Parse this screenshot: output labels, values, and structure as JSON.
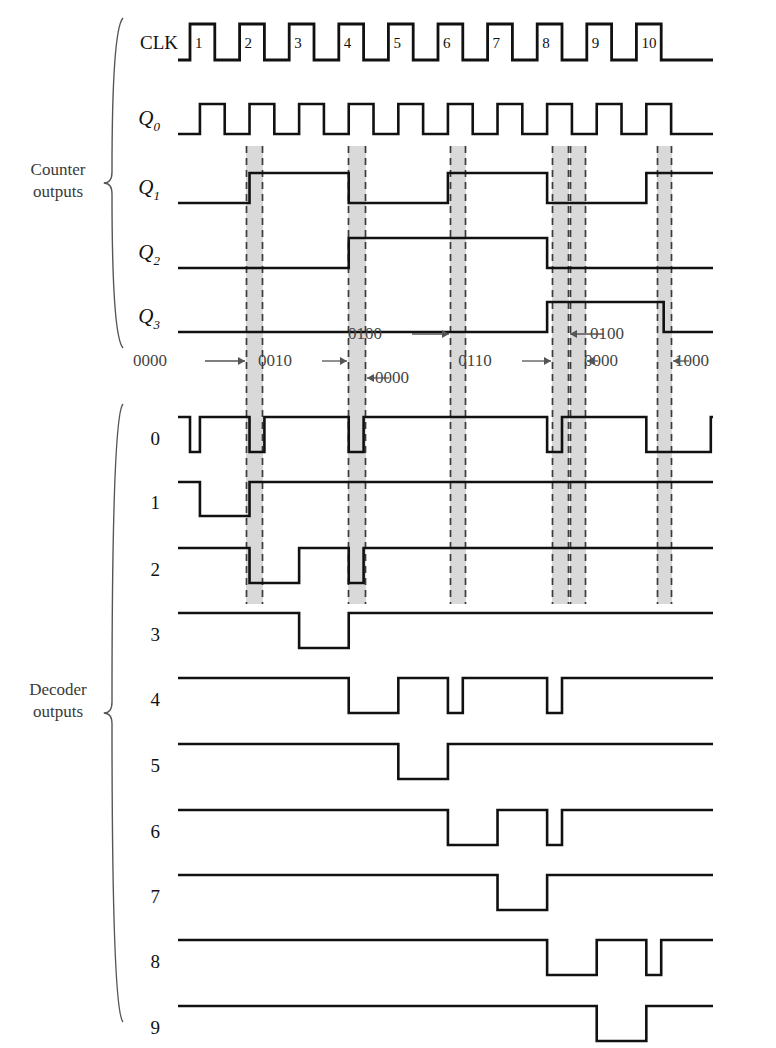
{
  "figure": {
    "type": "digital-timing-diagram",
    "groups": [
      {
        "id": "counter",
        "label_line1": "Counter",
        "label_line2": "outputs"
      },
      {
        "id": "decoder",
        "label_line1": "Decoder",
        "label_line2": "outputs"
      }
    ],
    "clock": {
      "label": "CLK",
      "pulse_numbers": [
        "1",
        "2",
        "3",
        "4",
        "5",
        "6",
        "7",
        "8",
        "9",
        "10"
      ]
    },
    "counter_signals": [
      {
        "name": "Q",
        "subscript": "0"
      },
      {
        "name": "Q",
        "subscript": "1"
      },
      {
        "name": "Q",
        "subscript": "2"
      },
      {
        "name": "Q",
        "subscript": "3"
      }
    ],
    "decoder_signals": [
      {
        "label": "0"
      },
      {
        "label": "1"
      },
      {
        "label": "2"
      },
      {
        "label": "3"
      },
      {
        "label": "4"
      },
      {
        "label": "5"
      },
      {
        "label": "6"
      },
      {
        "label": "7"
      },
      {
        "label": "8"
      },
      {
        "label": "9"
      }
    ],
    "state_annotations": [
      {
        "value": "0000",
        "direction": "right"
      },
      {
        "value": "0010",
        "direction": "right"
      },
      {
        "value": "0100",
        "direction": "right"
      },
      {
        "value": "0000",
        "direction": "left"
      },
      {
        "value": "0110",
        "direction": "right"
      },
      {
        "value": "0100",
        "direction": "left"
      },
      {
        "value": "0000",
        "direction": "left"
      },
      {
        "value": "1000",
        "direction": "left"
      }
    ],
    "glitch_band_count": 6,
    "colors": {
      "waveform": "#111111",
      "band_fill": "#b9b9b9",
      "band_dash": "#3b3b3b",
      "annotation": "#444444",
      "brace": "#555555",
      "background": "#ffffff"
    }
  },
  "chart_data": {
    "type": "line",
    "title": "",
    "xlabel": "",
    "ylabel": "",
    "grid": false,
    "geometry": {
      "t0": 190,
      "period": 49.6,
      "cycles": 10,
      "clk_high": 24,
      "clk_low": 60,
      "wave_right": 713
    },
    "glitch_bands": [
      {
        "x": 246,
        "w": 17,
        "after_clock": 2
      },
      {
        "x": 348,
        "w": 18,
        "after_clock": 4
      },
      {
        "x": 450,
        "w": 16,
        "after_clock": 6
      },
      {
        "x": 552,
        "w": 17,
        "after_clock": 8
      },
      {
        "x": 570,
        "w": 16,
        "after_clock": 8
      },
      {
        "x": 657,
        "w": 15,
        "after_clock": 10
      }
    ],
    "counter_waves": [
      {
        "name": "Q0",
        "baseline": 134,
        "high": 104,
        "edges": [
          0.2,
          1.2,
          2.2,
          3.2,
          4.2,
          5.2,
          6.2,
          7.2,
          8.2,
          9.2,
          10.2
        ],
        "start_level": 0
      },
      {
        "name": "Q1",
        "baseline": 203,
        "high": 173,
        "transitions": [
          [
            1.2,
            1
          ],
          [
            3.2,
            0
          ],
          [
            5.2,
            1
          ],
          [
            7.2,
            0
          ],
          [
            9.2,
            1
          ]
        ],
        "start_level": 0
      },
      {
        "name": "Q2",
        "baseline": 268,
        "high": 238,
        "transitions": [
          [
            3.2,
            1
          ],
          [
            7.2,
            0
          ]
        ],
        "start_level": 0
      },
      {
        "name": "Q3",
        "baseline": 332,
        "high": 302,
        "transitions": [
          [
            7.2,
            1
          ],
          [
            9.55,
            0
          ]
        ],
        "start_level": 0
      }
    ],
    "decoder_waves": [
      {
        "name": "0",
        "baseline": 452,
        "high": 417,
        "active_low": true,
        "low_windows": [
          [
            0.0,
            0.2
          ],
          [
            1.2,
            1.5
          ],
          [
            3.2,
            3.5
          ],
          [
            7.2,
            7.5
          ],
          [
            9.2,
            10.5
          ]
        ]
      },
      {
        "name": "1",
        "baseline": 516,
        "high": 482,
        "active_low": true,
        "low_windows": [
          [
            0.2,
            1.2
          ]
        ]
      },
      {
        "name": "2",
        "baseline": 583,
        "high": 548,
        "active_low": true,
        "low_windows": [
          [
            1.2,
            2.2
          ],
          [
            3.2,
            3.5
          ]
        ]
      },
      {
        "name": "3",
        "baseline": 648,
        "high": 613,
        "active_low": true,
        "low_windows": [
          [
            2.2,
            3.2
          ]
        ]
      },
      {
        "name": "4",
        "baseline": 713,
        "high": 678,
        "active_low": true,
        "low_windows": [
          [
            3.2,
            4.2
          ],
          [
            5.2,
            5.5
          ],
          [
            7.2,
            7.5
          ]
        ]
      },
      {
        "name": "5",
        "baseline": 779,
        "high": 744,
        "active_low": true,
        "low_windows": [
          [
            4.2,
            5.2
          ]
        ]
      },
      {
        "name": "6",
        "baseline": 845,
        "high": 810,
        "active_low": true,
        "low_windows": [
          [
            5.2,
            6.2
          ],
          [
            7.2,
            7.5
          ]
        ]
      },
      {
        "name": "7",
        "baseline": 910,
        "high": 875,
        "active_low": true,
        "low_windows": [
          [
            6.2,
            7.2
          ]
        ]
      },
      {
        "name": "8",
        "baseline": 975,
        "high": 940,
        "active_low": true,
        "low_windows": [
          [
            7.2,
            8.2
          ],
          [
            9.2,
            9.5
          ]
        ]
      },
      {
        "name": "9",
        "baseline": 1041,
        "high": 1006,
        "active_low": true,
        "low_windows": [
          [
            8.2,
            9.2
          ]
        ]
      }
    ],
    "annotation_positions": [
      {
        "value": "0000",
        "x": 150,
        "y": 366,
        "dir": "right",
        "ax1": 205,
        "ax2": 245
      },
      {
        "value": "0010",
        "x": 275,
        "y": 366,
        "dir": "right",
        "ax1": 322,
        "ax2": 347
      },
      {
        "value": "0100",
        "x": 365,
        "y": 339,
        "dir": "right",
        "ax1": 412,
        "ax2": 449
      },
      {
        "value": "0000",
        "x": 392,
        "y": 383,
        "dir": "left",
        "ax1": 389,
        "ax2": 367
      },
      {
        "value": "0110",
        "x": 475,
        "y": 366,
        "dir": "right",
        "ax1": 522,
        "ax2": 551
      },
      {
        "value": "0100",
        "x": 607,
        "y": 339,
        "dir": "left",
        "ax1": 604,
        "ax2": 570
      },
      {
        "value": "0000",
        "x": 601,
        "y": 366,
        "dir": "left",
        "ax1": 598,
        "ax2": 587
      },
      {
        "value": "1000",
        "x": 692,
        "y": 366,
        "dir": "left",
        "ax1": 689,
        "ax2": 673
      }
    ]
  }
}
